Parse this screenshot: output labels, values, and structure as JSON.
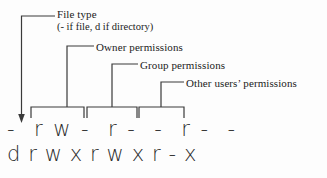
{
  "figure": {
    "background_color": "#fdfdfd",
    "line_color": "#3a3a3a",
    "text_color": "#1b1b1b"
  },
  "callouts": [
    {
      "id": "file-type",
      "label": "File type",
      "detail": "(- if file, d if directory)"
    },
    {
      "id": "owner",
      "label": "Owner permissions",
      "detail": ""
    },
    {
      "id": "group",
      "label": "Group permissions",
      "detail": ""
    },
    {
      "id": "other",
      "label": "Other users’ permissions",
      "detail": ""
    }
  ],
  "permission_strings": {
    "file_example": "-  r w -  r -  -  r -  -",
    "directory_example": "d r w x r w x r - x"
  }
}
